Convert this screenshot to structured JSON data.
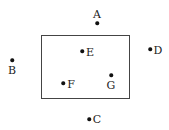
{
  "diagram": {
    "rectangle": {
      "left": 41,
      "top": 35,
      "right": 130,
      "bottom": 99,
      "stroke": "#444444"
    },
    "points": [
      {
        "name": "A",
        "x": 97,
        "y": 23,
        "label_x": 97,
        "label_y": 14
      },
      {
        "name": "B",
        "x": 12,
        "y": 60,
        "label_x": 12,
        "label_y": 70
      },
      {
        "name": "C",
        "x": 89,
        "y": 119,
        "label_x": 97,
        "label_y": 119
      },
      {
        "name": "D",
        "x": 150,
        "y": 49,
        "label_x": 158,
        "label_y": 50
      },
      {
        "name": "E",
        "x": 82,
        "y": 51,
        "label_x": 90,
        "label_y": 52
      },
      {
        "name": "F",
        "x": 63,
        "y": 83,
        "label_x": 71,
        "label_y": 84
      },
      {
        "name": "G",
        "x": 111,
        "y": 75,
        "label_x": 111,
        "label_y": 85
      }
    ]
  }
}
